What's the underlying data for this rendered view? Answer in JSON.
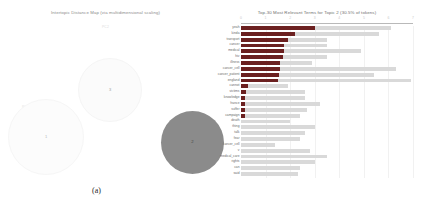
{
  "panel_a": {
    "title": "Intertopic Distance Map (via multidimensional scaling)",
    "axis_y_label": "PC2",
    "axis_x_label": "PC1",
    "caption": "(a)",
    "topics": [
      {
        "id": "1",
        "label": "1",
        "cx": 45,
        "cy": 136,
        "r": 37,
        "fill": "#fcfcfc"
      },
      {
        "id": "3",
        "label": "3",
        "cx": 109,
        "cy": 89,
        "r": 31,
        "fill": "#fbfbfb"
      },
      {
        "id": "2",
        "label": "2",
        "cx": 192,
        "cy": 142,
        "r": 31.5,
        "fill": "#8b8b8b"
      }
    ]
  },
  "panel_b": {
    "title": "Top-30 Most Relevant Terms for Topic 2 (30.5% of tokens)",
    "caption": "(b)",
    "xticks": [
      "0",
      "1",
      "2",
      "3",
      "4",
      "5",
      "6",
      "7"
    ],
    "xlim": [
      0,
      7
    ],
    "colors": {
      "overall": "#d9d9d9",
      "estimated": "#6b2020"
    }
  },
  "chart_data": {
    "type": "bar",
    "orientation": "horizontal",
    "title": "Top-30 Most Relevant Terms for Topic 2 (30.5% of tokens)",
    "xlabel": "",
    "ylabel": "",
    "xlim": [
      0,
      7
    ],
    "grid": true,
    "legend": [
      "Overall term frequency",
      "Estimated term frequency within the selected topic"
    ],
    "categories": [
      "yeah",
      "kinda",
      "transport",
      "cancer",
      "medical",
      "hiv",
      "illness",
      "cancer_cell",
      "cancer_patient",
      "england",
      "cannot",
      "victims",
      "knowledge",
      "france",
      "suffer",
      "campaign",
      "death",
      "thing",
      "talk",
      "fear",
      "cancer_cell",
      "v",
      "medical_care",
      "rights",
      "can",
      "said"
    ],
    "series": [
      {
        "name": "Overall term frequency",
        "values": [
          6.1,
          5.6,
          3.5,
          3.5,
          4.9,
          3.5,
          2.9,
          6.3,
          5.4,
          6.9,
          1.9,
          2.6,
          2.6,
          3.2,
          2.7,
          2.4,
          2.0,
          3.0,
          2.6,
          2.4,
          1.4,
          2.8,
          3.5,
          3.0,
          2.4,
          2.3
        ]
      },
      {
        "name": "Estimated term frequency within the selected topic",
        "values": [
          3.0,
          2.2,
          1.9,
          1.75,
          1.75,
          1.7,
          1.6,
          1.6,
          1.55,
          1.5,
          0.28,
          0.2,
          0.18,
          0.17,
          0.16,
          0.15,
          0.0,
          0.0,
          0.0,
          0.0,
          0.0,
          0.0,
          0.0,
          0.0,
          0.0,
          0.0
        ]
      }
    ]
  }
}
